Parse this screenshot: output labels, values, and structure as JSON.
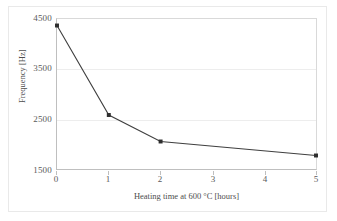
{
  "chart_data": {
    "type": "line",
    "title": "",
    "xlabel": "Heating time at 600 °C [hours]",
    "ylabel": "Frequency [Hz]",
    "xlim": [
      0,
      5
    ],
    "ylim": [
      1500,
      4500
    ],
    "xticks": [
      "0",
      "1",
      "2",
      "3",
      "4",
      "5"
    ],
    "yticks": [
      "1500",
      "2500",
      "3500",
      "4500"
    ],
    "grid": "horizontal",
    "legend": "none",
    "series": [
      {
        "name": "Frequency",
        "color": "#3f3f3f",
        "marker": "square",
        "x": [
          0,
          1,
          2,
          5
        ],
        "values": [
          4370,
          2580,
          2050,
          1770
        ]
      }
    ]
  },
  "axes": {
    "y_tick_0": "1500",
    "y_tick_1": "2500",
    "y_tick_2": "3500",
    "y_tick_3": "4500",
    "x_tick_0": "0",
    "x_tick_1": "1",
    "x_tick_2": "2",
    "x_tick_3": "3",
    "x_tick_4": "4",
    "x_tick_5": "5",
    "x_title": "Heating time at 600 °C [hours]",
    "y_title": "Frequency [Hz]"
  },
  "colors": {
    "series": "#3f3f3f",
    "grid": "#ededed",
    "axis": "#bfbfbf",
    "frame": "#e9e9e9",
    "tick_text": "#5a5a5a",
    "title_text": "#4d4d4d"
  }
}
